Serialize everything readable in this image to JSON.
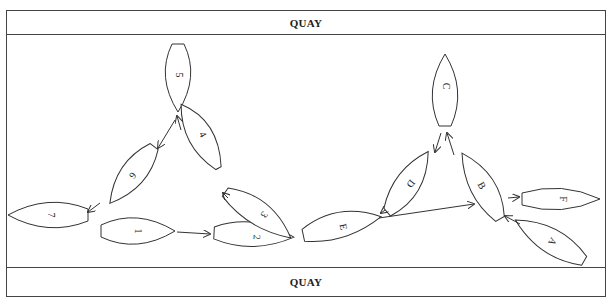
{
  "quays": {
    "top_label": "QUAY",
    "bottom_label": "QUAY"
  },
  "left_group": {
    "boats": [
      {
        "id": "1",
        "label": "1"
      },
      {
        "id": "2",
        "label": "2"
      },
      {
        "id": "3",
        "label": "3"
      },
      {
        "id": "4",
        "label": "4"
      },
      {
        "id": "5",
        "label": "5"
      },
      {
        "id": "6",
        "label": "6"
      },
      {
        "id": "7",
        "label": "7"
      }
    ],
    "moves": [
      "1→2",
      "3→4",
      "4→5",
      "5→6",
      "6→7"
    ]
  },
  "right_group": {
    "boats": [
      {
        "id": "A",
        "label": "A"
      },
      {
        "id": "B",
        "label": "B"
      },
      {
        "id": "C",
        "label": "C"
      },
      {
        "id": "D",
        "label": "D"
      },
      {
        "id": "E",
        "label": "E"
      },
      {
        "id": "F",
        "label": "F"
      }
    ],
    "moves": [
      "A→B",
      "B→C",
      "C→D",
      "D→E",
      "E→B",
      "B→F"
    ]
  },
  "colors": {
    "stroke": "#333333",
    "background": "#ffffff"
  }
}
